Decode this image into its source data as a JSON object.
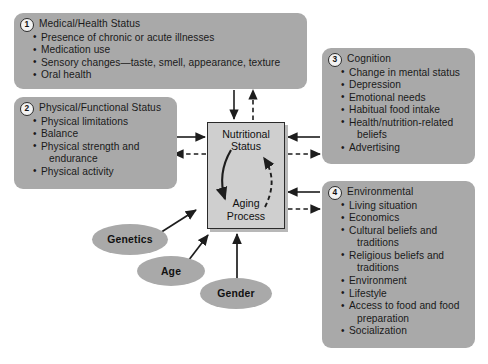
{
  "diagram": {
    "colors": {
      "panel_fill": "#a9a9a9",
      "center_fill": "#cfcfcf",
      "stroke": "#2a2a2a",
      "background": "#ffffff"
    },
    "center_node": {
      "top_label": "Nutritional\nStatus",
      "top_line1": "Nutritional",
      "top_line2": "Status",
      "bottom_line1": "Aging",
      "bottom_line2": "Process"
    },
    "panels": [
      {
        "number": "1",
        "title": "Medical/Health Status",
        "items": [
          "Presence of chronic or acute illnesses",
          "Medication use",
          "Sensory changes—taste, smell, appearance, texture",
          "Oral health"
        ]
      },
      {
        "number": "2",
        "title": "Physical/Functional Status",
        "items": [
          "Physical limitations",
          "Balance",
          "Physical strength and",
          "endurance",
          "Physical activity"
        ],
        "continuation_indexes": [
          3
        ]
      },
      {
        "number": "3",
        "title": "Cognition",
        "items": [
          "Change in mental status",
          "Depression",
          "Emotional needs",
          "Habitual food intake",
          "Health/nutrition-related",
          "beliefs",
          "Advertising"
        ],
        "continuation_indexes": [
          5
        ]
      },
      {
        "number": "4",
        "title": "Environmental",
        "items": [
          "Living situation",
          "Economics",
          "Cultural beliefs and",
          "traditions",
          "Religious beliefs and",
          "traditions",
          "Environment",
          "Lifestyle",
          "Access to food and food",
          "preparation",
          "Socialization"
        ],
        "continuation_indexes": [
          3,
          5,
          9
        ]
      }
    ],
    "ellipses": [
      {
        "label": "Genetics"
      },
      {
        "label": "Age"
      },
      {
        "label": "Gender"
      }
    ],
    "edges": [
      {
        "from": "panel-1",
        "to": "center-node",
        "style": "solid",
        "direction": "down"
      },
      {
        "from": "center-node",
        "to": "panel-1",
        "style": "dashed",
        "direction": "up"
      },
      {
        "from": "panel-2",
        "to": "center-node",
        "style": "solid",
        "direction": "right"
      },
      {
        "from": "center-node",
        "to": "panel-2",
        "style": "dashed",
        "direction": "left"
      },
      {
        "from": "panel-3",
        "to": "center-node",
        "style": "solid",
        "direction": "left"
      },
      {
        "from": "center-node",
        "to": "panel-3",
        "style": "dashed",
        "direction": "right"
      },
      {
        "from": "panel-4",
        "to": "center-node",
        "style": "solid",
        "direction": "left"
      },
      {
        "from": "center-node",
        "to": "panel-4",
        "style": "dashed",
        "direction": "right"
      },
      {
        "from": "ellipse-genetics",
        "to": "center-node",
        "style": "solid",
        "direction": "up-right"
      },
      {
        "from": "ellipse-age",
        "to": "center-node",
        "style": "solid",
        "direction": "up-right"
      },
      {
        "from": "ellipse-gender",
        "to": "center-node",
        "style": "solid",
        "direction": "up"
      },
      {
        "from": "nutritional-status",
        "to": "aging-process",
        "style": "solid-curve",
        "direction": "clockwise-left"
      },
      {
        "from": "aging-process",
        "to": "nutritional-status",
        "style": "dashed-curve",
        "direction": "clockwise-right"
      }
    ]
  }
}
